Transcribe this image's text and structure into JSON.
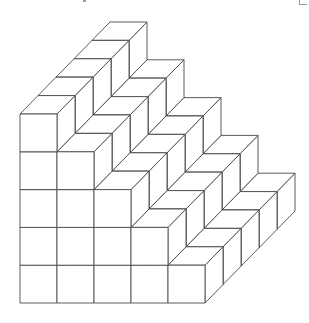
{
  "figure": {
    "type": "isometric-cube-staircase",
    "columns": 5,
    "depth": 5,
    "column_heights": [
      5,
      4,
      3,
      2,
      1
    ],
    "total_cubes": 75,
    "line_color": "#4a4a4a",
    "fill_color": "#ffffff"
  }
}
